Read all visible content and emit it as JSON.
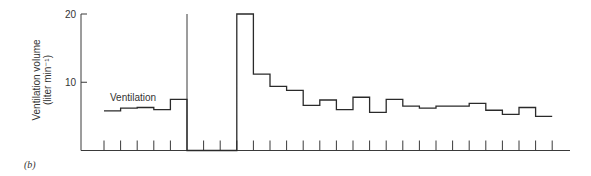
{
  "chart_data": {
    "type": "line",
    "style": "step",
    "title": "",
    "panel_label": "(b)",
    "xlabel": "",
    "ylabel_line1": "Ventilation volume",
    "ylabel_line2": "(liter min⁻¹)",
    "ylim": [
      0,
      20
    ],
    "yticks": [
      10,
      20
    ],
    "ytick_labels": [
      "10",
      "20"
    ],
    "grid": false,
    "series_label": "Ventilation",
    "x_intervals": 27,
    "x_tick_count": 28,
    "series": [
      {
        "name": "Ventilation",
        "values": [
          5.8,
          6.2,
          6.3,
          6.0,
          7.5,
          0,
          0,
          0,
          20,
          11.2,
          9.4,
          8.8,
          6.6,
          7.4,
          6.0,
          7.8,
          5.6,
          7.5,
          6.5,
          6.2,
          6.5,
          6.5,
          6.9,
          5.9,
          5.3,
          6.3,
          5.0
        ]
      }
    ],
    "annotations": [
      {
        "type": "vertical-line",
        "at_interval": 5,
        "from": 0,
        "to": 20
      }
    ]
  }
}
